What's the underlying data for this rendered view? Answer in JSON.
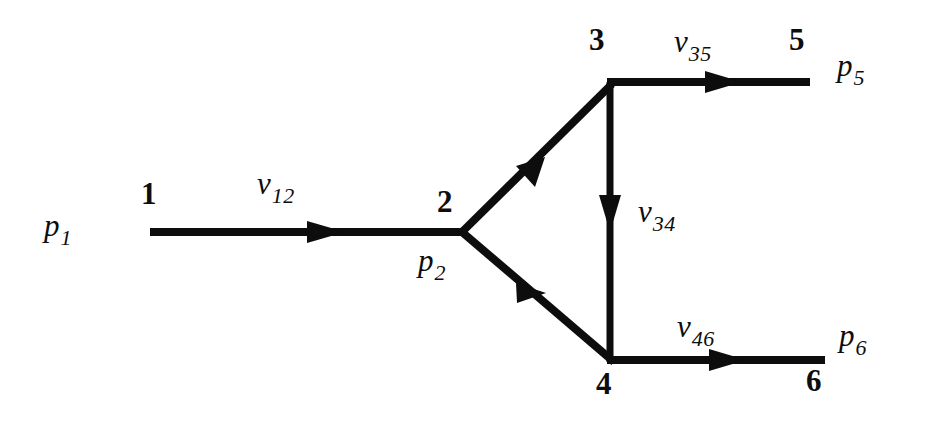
{
  "diagram": {
    "type": "directed-graph",
    "background_color": "#ffffff",
    "stroke_color": "#0d0d0d",
    "nodes": [
      {
        "id": "1",
        "label": "1",
        "x": 150,
        "y": 232,
        "pressure_label": "p",
        "pressure_sub": "1"
      },
      {
        "id": "2",
        "label": "2",
        "x": 462,
        "y": 232,
        "pressure_label": "p",
        "pressure_sub": "2"
      },
      {
        "id": "3",
        "label": "3",
        "x": 610,
        "y": 82,
        "pressure_label": "",
        "pressure_sub": ""
      },
      {
        "id": "4",
        "label": "4",
        "x": 610,
        "y": 360,
        "pressure_label": "",
        "pressure_sub": ""
      },
      {
        "id": "5",
        "label": "5",
        "x": 810,
        "y": 82,
        "pressure_label": "p",
        "pressure_sub": "5"
      },
      {
        "id": "6",
        "label": "6",
        "x": 825,
        "y": 360,
        "pressure_label": "p",
        "pressure_sub": "6"
      }
    ],
    "edges": [
      {
        "id": "e12",
        "from": "1",
        "to": "2",
        "var": "v",
        "sub": "12",
        "orientation": "horizontal"
      },
      {
        "id": "e23",
        "from": "2",
        "to": "3",
        "var": "",
        "sub": "",
        "orientation": "diagonal-up"
      },
      {
        "id": "e24",
        "from": "2",
        "to": "4",
        "var": "",
        "sub": "",
        "orientation": "diagonal-down"
      },
      {
        "id": "e34",
        "from": "3",
        "to": "4",
        "var": "v",
        "sub": "34",
        "orientation": "vertical"
      },
      {
        "id": "e35",
        "from": "3",
        "to": "5",
        "var": "v",
        "sub": "35",
        "orientation": "horizontal"
      },
      {
        "id": "e46",
        "from": "4",
        "to": "6",
        "var": "v",
        "sub": "46",
        "orientation": "horizontal"
      }
    ],
    "labels": {
      "p1": {
        "base": "p",
        "sub": "1"
      },
      "p2": {
        "base": "p",
        "sub": "2"
      },
      "p5": {
        "base": "p",
        "sub": "5"
      },
      "p6": {
        "base": "p",
        "sub": "6"
      },
      "v12": {
        "base": "v",
        "sub": "12"
      },
      "v34": {
        "base": "v",
        "sub": "34"
      },
      "v35": {
        "base": "v",
        "sub": "35"
      },
      "v46": {
        "base": "v",
        "sub": "46"
      },
      "n1": "1",
      "n2": "2",
      "n3": "3",
      "n4": "4",
      "n5": "5",
      "n6": "6"
    }
  }
}
